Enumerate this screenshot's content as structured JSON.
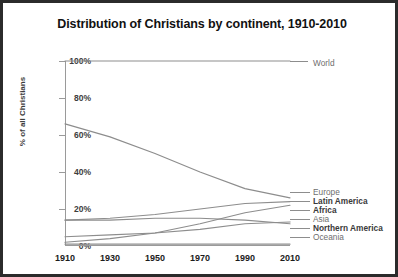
{
  "chart_data": {
    "type": "line",
    "title": "Distribution of Christians by continent, 1910-2010",
    "xlabel": "",
    "ylabel": "% of all Christians",
    "x": [
      1910,
      1930,
      1950,
      1970,
      1990,
      2010
    ],
    "xlim": [
      1910,
      2010
    ],
    "ylim": [
      0,
      100
    ],
    "yticks": [
      0,
      20,
      40,
      60,
      80,
      100
    ],
    "ytick_labels": [
      "0%",
      "20%",
      "40%",
      "60%",
      "80%",
      "100%"
    ],
    "xtick_labels": [
      "1910",
      "1930",
      "1950",
      "1970",
      "1990",
      "2010"
    ],
    "grid": false,
    "legend_position": "inline-right",
    "series": [
      {
        "name": "World",
        "values": [
          100,
          100,
          100,
          100,
          100,
          100
        ],
        "label_bold": false
      },
      {
        "name": "Europe",
        "values": [
          66,
          59,
          50,
          40,
          31,
          26
        ],
        "label_bold": false
      },
      {
        "name": "Latin America",
        "values": [
          14,
          15,
          17,
          20,
          23,
          24
        ],
        "label_bold": true
      },
      {
        "name": "Africa",
        "values": [
          2,
          4,
          7,
          12,
          18,
          22
        ],
        "label_bold": true
      },
      {
        "name": "Asia",
        "values": [
          5,
          6,
          7,
          9,
          12,
          13
        ],
        "label_bold": false
      },
      {
        "name": "Northern America",
        "values": [
          14,
          14,
          15,
          15,
          14,
          12
        ],
        "label_bold": true
      },
      {
        "name": "Oceania",
        "values": [
          1,
          1,
          1,
          1,
          1,
          1
        ],
        "label_bold": false
      }
    ]
  },
  "colors": {
    "line": "#8d8d8d",
    "axis": "#9a9a9a",
    "title_text": "#111111",
    "tick_text": "#3d3d3d",
    "label_text": "#6e6e6e",
    "label_text_bold": "#3a3a3a",
    "border": "#2b2b2b",
    "background": "#ffffff"
  }
}
